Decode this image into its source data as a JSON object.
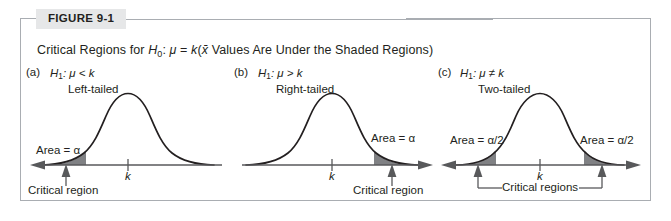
{
  "figure": {
    "badge_label": "FIGURE 9-1",
    "caption_prefix": "Critical Regions for ",
    "caption_h": "H",
    "caption_h_sub": "0",
    "caption_mid": ": ",
    "caption_mu": "μ",
    "caption_eq": " = ",
    "caption_k": "k",
    "caption_paren_open": "(",
    "caption_xbar": "x̄",
    "caption_tail": " Values Are Under the Shaded Regions)",
    "caption_full": "Critical Regions for H0: μ = k(x̄ Values Are Under the Shaded Regions)"
  },
  "panels": [
    {
      "tag": "(a)",
      "hypothesis_h": "H",
      "hypothesis_sub": "1",
      "hypothesis_rest": ": μ < k",
      "tail_label": "Left-tailed",
      "area_label": "Area = α",
      "axis_tick_label": "k",
      "region_label": "Critical region",
      "shade_side": "left"
    },
    {
      "tag": "(b)",
      "hypothesis_h": "H",
      "hypothesis_sub": "1",
      "hypothesis_rest": ": μ > k",
      "tail_label": "Right-tailed",
      "area_label": "Area = α",
      "axis_tick_label": "k",
      "region_label": "Critical region",
      "shade_side": "right"
    },
    {
      "tag": "(c)",
      "hypothesis_h": "H",
      "hypothesis_sub": "1",
      "hypothesis_rest": ": μ ≠ k",
      "tail_label": "Two-tailed",
      "area_label_left": "Area = α/2",
      "area_label_right": "Area = α/2",
      "axis_tick_label": "k",
      "region_label": "Critical regions",
      "shade_side": "both"
    }
  ],
  "colors": {
    "shade_fill": "#808184",
    "curve_stroke": "#231f20",
    "axis_stroke": "#58595b",
    "frame_border": "#a9adb2",
    "badge_bg": "#e6e7e8",
    "text": "#231f20"
  }
}
